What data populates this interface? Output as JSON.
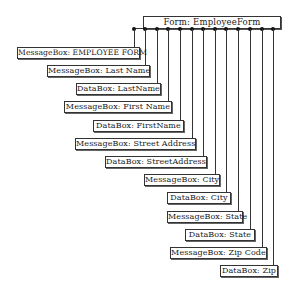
{
  "diagram": {
    "root": {
      "label": "Form: EmployeeForm"
    },
    "children": [
      {
        "label": "MessageBox:  EMPLOYEE FORM",
        "type": "MessageBox"
      },
      {
        "label": "MessageBox:  Last Name",
        "type": "MessageBox"
      },
      {
        "label": "DataBox: LastName",
        "type": "DataBox"
      },
      {
        "label": "MessageBox: First Name",
        "type": "MessageBox"
      },
      {
        "label": "DataBox: FirstName",
        "type": "DataBox"
      },
      {
        "label": "MessageBox: Street Address",
        "type": "MessageBox"
      },
      {
        "label": "DataBox: StreetAddress",
        "type": "DataBox"
      },
      {
        "label": "MessageBox: City",
        "type": "MessageBox"
      },
      {
        "label": "DataBox: City",
        "type": "DataBox"
      },
      {
        "label": "MessageBox: State",
        "type": "MessageBox"
      },
      {
        "label": "DataBox: State",
        "type": "DataBox"
      },
      {
        "label": "MessageBox: Zip Code",
        "type": "MessageBox"
      },
      {
        "label": "DataBox: Zip",
        "type": "DataBox"
      }
    ]
  }
}
